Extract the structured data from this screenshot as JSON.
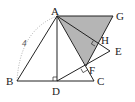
{
  "diagram": {
    "type": "geometry",
    "points": {
      "A": {
        "label": "A",
        "x": 57,
        "y": 16
      },
      "G": {
        "label": "G",
        "x": 113,
        "y": 16
      },
      "H": {
        "label": "H",
        "x": 97,
        "y": 43
      },
      "E": {
        "label": "E",
        "x": 110,
        "y": 51
      },
      "F": {
        "label": "F",
        "x": 86,
        "y": 66
      },
      "B": {
        "label": "B",
        "x": 17,
        "y": 81
      },
      "D": {
        "label": "D",
        "x": 57,
        "y": 81
      },
      "C": {
        "label": "C",
        "x": 94,
        "y": 81
      }
    },
    "length_label": "4",
    "shaded_region": [
      "A",
      "G",
      "F"
    ],
    "shade_color": "#b5b5b5",
    "line_color": "#222222",
    "right_angles": [
      "D",
      "F",
      "H"
    ]
  }
}
